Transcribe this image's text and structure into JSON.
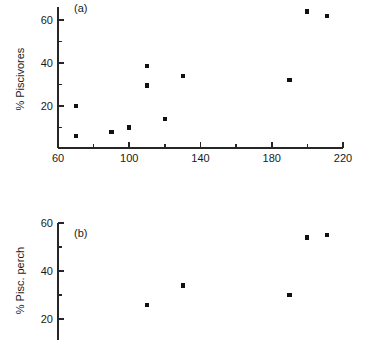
{
  "figure": {
    "background_color": "#ffffff",
    "marker_color": "#111111",
    "axis_color": "#262626"
  },
  "chart_data": [
    {
      "type": "scatter",
      "panel": "(a)",
      "title": "",
      "xlabel": "",
      "ylabel": "% Piscivores",
      "xlim": [
        60,
        220
      ],
      "ylim": [
        0,
        66
      ],
      "grid": false,
      "legend": null,
      "x_major_ticks": [
        60,
        100,
        140,
        180,
        220
      ],
      "x_major_tick_labels": [
        "60",
        "100",
        "140",
        "180",
        "220"
      ],
      "x_minor_ticks": [
        80,
        120,
        160,
        200
      ],
      "y_major_ticks": [
        20,
        40,
        60
      ],
      "y_major_tick_labels": [
        "20",
        "40",
        "60"
      ],
      "y_minor_ticks": [
        10,
        30,
        50
      ],
      "x": [
        70,
        70,
        90,
        100,
        110,
        110,
        120,
        130,
        190,
        200,
        211
      ],
      "y": [
        20,
        6,
        8,
        10,
        38.5,
        29.5,
        14,
        34,
        32,
        64,
        62
      ],
      "points": [
        {
          "x": 70,
          "y": 20
        },
        {
          "x": 70,
          "y": 6
        },
        {
          "x": 90,
          "y": 8
        },
        {
          "x": 100,
          "y": 10
        },
        {
          "x": 110,
          "y": 38.5
        },
        {
          "x": 110,
          "y": 29.5
        },
        {
          "x": 120,
          "y": 14
        },
        {
          "x": 130,
          "y": 34
        },
        {
          "x": 190,
          "y": 32
        },
        {
          "x": 200,
          "y": 64
        },
        {
          "x": 211,
          "y": 62
        }
      ]
    },
    {
      "type": "scatter",
      "panel": "(b)",
      "title": "",
      "xlabel": "",
      "ylabel": "% Pisc. perch",
      "xlim": [
        60,
        220
      ],
      "ylim": [
        14,
        62
      ],
      "grid": false,
      "legend": null,
      "y_major_ticks": [
        20,
        40,
        60
      ],
      "y_major_tick_labels": [
        "20",
        "40",
        "60"
      ],
      "y_minor_ticks": [
        30,
        50
      ],
      "x": [
        110,
        130,
        190,
        200,
        211
      ],
      "y": [
        26,
        34,
        30,
        54,
        55
      ],
      "points": [
        {
          "x": 110,
          "y": 26
        },
        {
          "x": 130,
          "y": 34
        },
        {
          "x": 190,
          "y": 30
        },
        {
          "x": 200,
          "y": 54
        },
        {
          "x": 211,
          "y": 55
        }
      ]
    }
  ]
}
